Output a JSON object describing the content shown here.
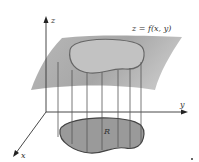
{
  "figure": {
    "axes": {
      "z_label": "z",
      "y_label": "y",
      "x_label": "x"
    },
    "surface_label": "z = f(x, y)",
    "region_label": "R",
    "colors": {
      "surface": "#a8a8a8",
      "region": "#9a9a9a",
      "lines": "#444444"
    }
  }
}
